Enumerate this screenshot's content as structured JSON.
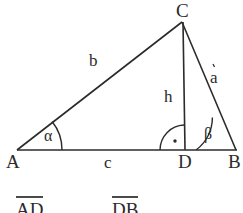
{
  "figure": {
    "kind": "right-triangle-with-altitude",
    "stroke_color": "#2b2b2b",
    "background_color": "#ffffff",
    "vertices": {
      "A": {
        "label": "A",
        "x": 17,
        "y": 150
      },
      "B": {
        "label": "B",
        "x": 236,
        "y": 150
      },
      "C": {
        "label": "C",
        "x": 182,
        "y": 22
      },
      "D": {
        "label": "D",
        "x": 185,
        "y": 150
      }
    },
    "side_labels": {
      "b": "b",
      "a": "a",
      "c": "c",
      "h": "h"
    },
    "angle_labels": {
      "alpha": "α",
      "beta": "β"
    },
    "right_angle": {
      "marker": "right-angle-dot",
      "at": "D"
    }
  },
  "footer": {
    "terms": [
      {
        "text": "AD",
        "overline": true
      },
      {
        "text": "DB",
        "overline": true
      }
    ]
  }
}
